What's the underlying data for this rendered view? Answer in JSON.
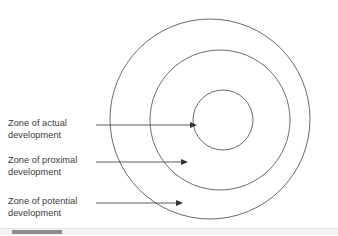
{
  "figure": {
    "background_color": "#ffffff",
    "stroke_color": "#5a5a5a",
    "text_color": "#3b3b3b"
  },
  "labels": {
    "actual": "Zone of actual\ndevelopment",
    "proximal": "Zone of proximal\ndevelopment",
    "potential": "Zone of potential\ndevelopment"
  },
  "diagram": {
    "type": "concentric-circles",
    "circles": [
      {
        "name": "zone-of-potential-development",
        "label": "Zone of potential development",
        "cx": 210,
        "cy": 119,
        "r": 100,
        "level": "outer"
      },
      {
        "name": "zone-of-proximal-development",
        "label": "Zone of proximal development",
        "cx": 220,
        "cy": 120,
        "r": 70,
        "level": "middle"
      },
      {
        "name": "zone-of-actual-development",
        "label": "Zone of actual development",
        "cx": 223,
        "cy": 120,
        "r": 30,
        "level": "inner"
      }
    ],
    "pointers": [
      {
        "name": "pointer-actual",
        "x1": 96,
        "y1": 125,
        "x2": 197,
        "y2": 125,
        "target": "zone-of-actual-development"
      },
      {
        "name": "pointer-proximal",
        "x1": 96,
        "y1": 162,
        "x2": 188,
        "y2": 162,
        "target": "zone-of-proximal-development"
      },
      {
        "name": "pointer-potential",
        "x1": 96,
        "y1": 203,
        "x2": 183,
        "y2": 203,
        "target": "zone-of-potential-development"
      }
    ]
  },
  "scrollbar": {
    "name": "horizontal-scrollbar",
    "orientation": "horizontal",
    "thumb_color": "#8d8d8d",
    "track_color": "#f2f2f2"
  }
}
